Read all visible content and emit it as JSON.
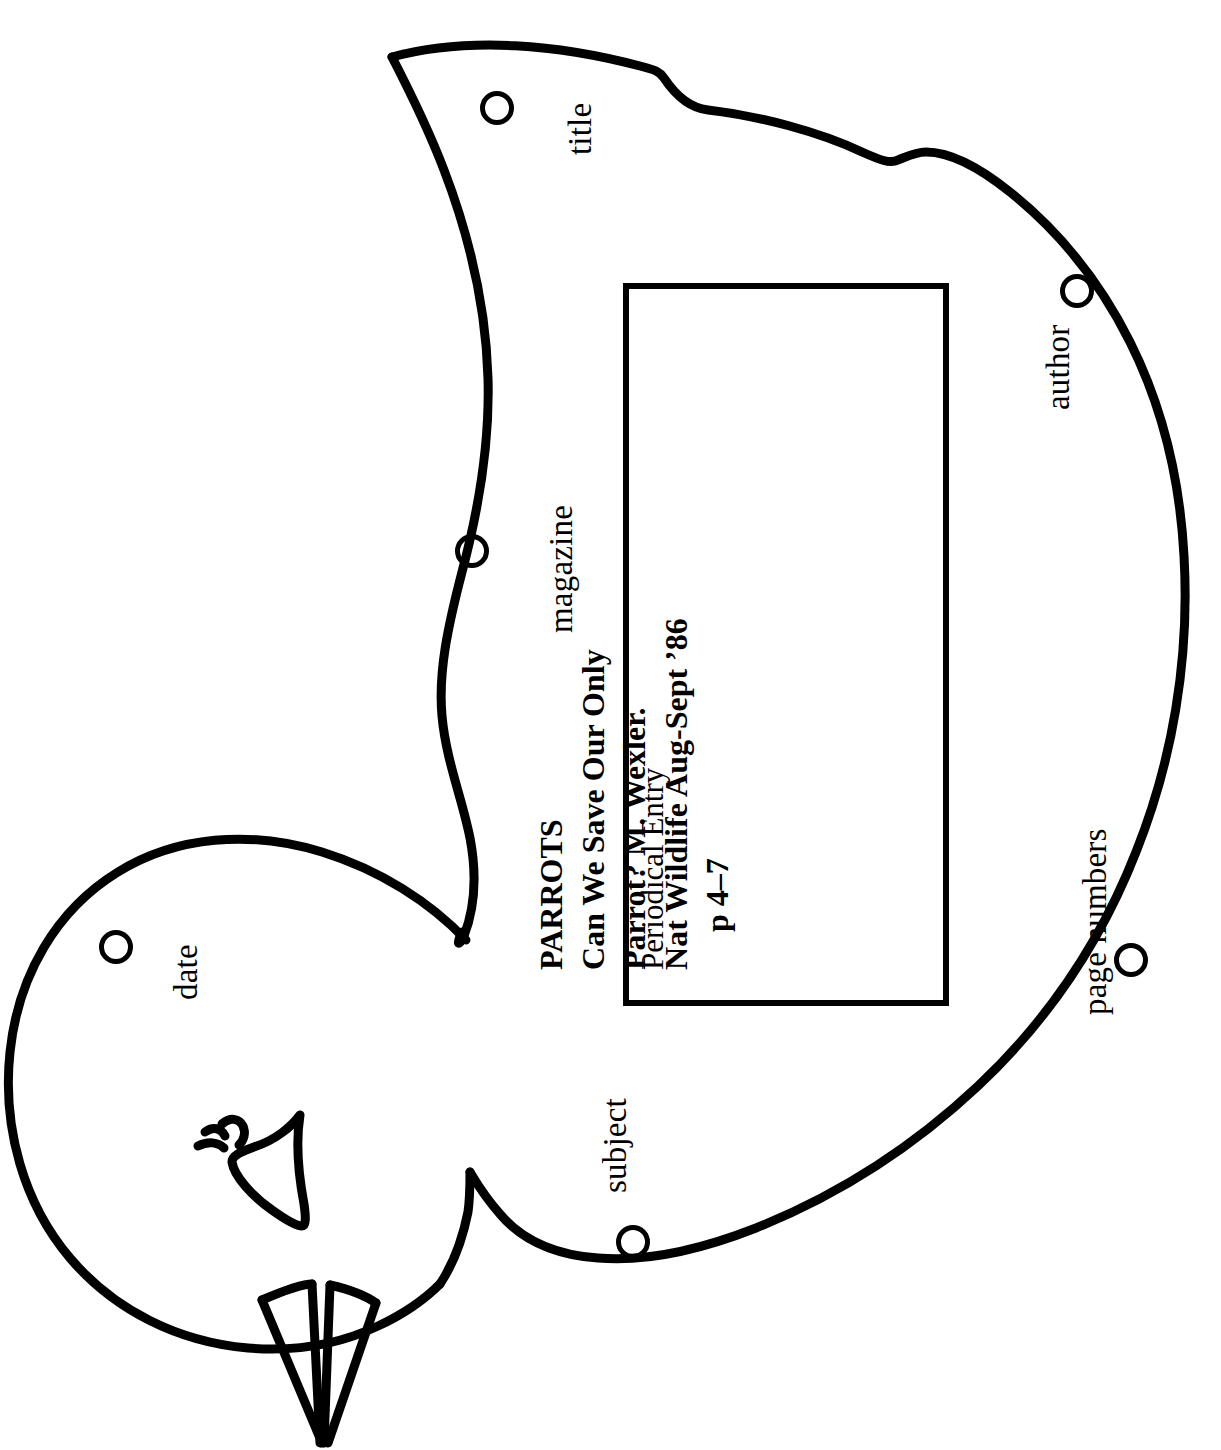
{
  "page": {
    "ink_color": "#000000",
    "background_color": "#ffffff"
  },
  "shape": {
    "name": "parrot-outline",
    "orientation": "rotated-90-ccw",
    "parts": [
      "head",
      "beak",
      "eye",
      "body",
      "wing",
      "tail-feathers"
    ]
  },
  "holes": [
    {
      "id": "title",
      "label": "title",
      "cx": 497,
      "cy": 108,
      "r": 17,
      "label_x": 562,
      "label_y": 155
    },
    {
      "id": "author",
      "label": "author",
      "cx": 1077,
      "cy": 291,
      "r": 17,
      "label_x": 1040,
      "label_y": 410
    },
    {
      "id": "magazine",
      "label": "magazine",
      "cx": 472,
      "cy": 551,
      "r": 17,
      "label_x": 543,
      "label_y": 633
    },
    {
      "id": "date",
      "label": "date",
      "cx": 116,
      "cy": 947,
      "r": 17,
      "label_x": 168,
      "label_y": 1000
    },
    {
      "id": "page-numbers",
      "label": "page numbers",
      "cx": 1131,
      "cy": 960,
      "r": 17,
      "label_x": 1077,
      "label_y": 1015
    },
    {
      "id": "subject",
      "label": "subject",
      "cx": 633,
      "cy": 1242,
      "r": 17,
      "label_x": 597,
      "label_y": 1193
    }
  ],
  "entry_card": {
    "heading": "Periodical Entry",
    "lines": [
      "PARROTS",
      "Can We Save Our Only",
      "Parrot? M. Wexler.",
      "Nat Wildlife Aug-Sept ’86",
      "p 4–7"
    ],
    "indented_lines": [
      false,
      false,
      false,
      false,
      true
    ],
    "border_color": "#000000"
  }
}
